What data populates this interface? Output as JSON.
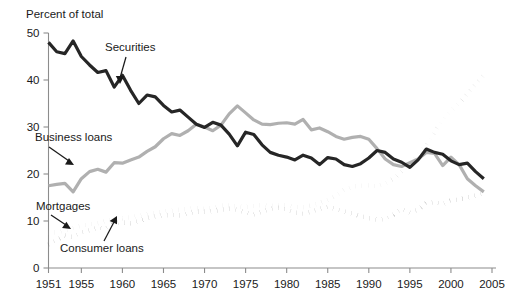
{
  "chart_data": {
    "type": "line",
    "title": "",
    "ylabel": "Percent of total",
    "xlabel": "",
    "xlim": [
      1951,
      2005
    ],
    "ylim": [
      0,
      50
    ],
    "grid": false,
    "legend_position": "inline-annotations",
    "y_ticks": [
      "0",
      "10",
      "20",
      "30",
      "40",
      "50"
    ],
    "y_tick_values": [
      0,
      10,
      20,
      30,
      40,
      50
    ],
    "x_ticks": [
      "1951",
      "1955",
      "1960",
      "1965",
      "1970",
      "1975",
      "1980",
      "1985",
      "1990",
      "1995",
      "2000",
      "2005"
    ],
    "x_tick_values": [
      1951,
      1955,
      1960,
      1965,
      1970,
      1975,
      1980,
      1985,
      1990,
      1995,
      2000,
      2005
    ],
    "x": [
      1951,
      1952,
      1953,
      1954,
      1955,
      1956,
      1957,
      1958,
      1959,
      1960,
      1961,
      1962,
      1963,
      1964,
      1965,
      1966,
      1967,
      1968,
      1969,
      1970,
      1971,
      1972,
      1973,
      1974,
      1975,
      1976,
      1977,
      1978,
      1979,
      1980,
      1981,
      1982,
      1983,
      1984,
      1985,
      1986,
      1987,
      1988,
      1989,
      1990,
      1991,
      1992,
      1993,
      1994,
      1995,
      1996,
      1997,
      1998,
      1999,
      2000,
      2001,
      2002,
      2003,
      2004
    ],
    "series": [
      {
        "name": "Securities",
        "style": "solid",
        "color": "#262626",
        "line_width": 3.2,
        "values": [
          48.0,
          46.0,
          45.6,
          48.3,
          45.0,
          43.2,
          41.6,
          42.0,
          38.5,
          41.0,
          37.8,
          35.0,
          36.8,
          36.4,
          34.6,
          33.2,
          33.6,
          32.1,
          30.6,
          29.9,
          31.0,
          30.4,
          28.5,
          26.0,
          28.9,
          28.4,
          26.2,
          24.6,
          24.0,
          23.6,
          23.0,
          24.0,
          23.4,
          22.0,
          23.5,
          23.2,
          22.0,
          21.6,
          22.2,
          23.4,
          25.0,
          24.6,
          23.2,
          22.5,
          21.4,
          23.0,
          25.3,
          24.6,
          24.2,
          22.8,
          22.0,
          22.3,
          20.5,
          19.0
        ]
      },
      {
        "name": "Business loans",
        "style": "solid",
        "color": "#b0b0b0",
        "line_width": 3.2,
        "values": [
          17.5,
          17.8,
          18.0,
          16.2,
          19.0,
          20.5,
          21.0,
          20.4,
          22.4,
          22.3,
          23.0,
          23.6,
          24.8,
          25.8,
          27.5,
          28.6,
          28.2,
          29.2,
          30.6,
          30.0,
          29.2,
          30.4,
          32.8,
          34.5,
          33.0,
          31.5,
          30.6,
          30.5,
          30.8,
          30.9,
          30.6,
          31.6,
          29.4,
          29.8,
          29.0,
          28.0,
          27.4,
          27.8,
          28.0,
          27.4,
          25.4,
          23.2,
          22.0,
          21.6,
          22.4,
          23.2,
          24.6,
          24.4,
          21.8,
          23.6,
          22.0,
          19.0,
          17.5,
          16.2
        ]
      },
      {
        "name": "Mortgages",
        "style": "dotted",
        "color": "#b8b8b8",
        "line_width": 4.6,
        "values": [
          7.5,
          7.6,
          8.0,
          8.5,
          9.0,
          9.3,
          9.5,
          10.0,
          10.5,
          10.6,
          10.8,
          11.1,
          11.4,
          11.8,
          12.0,
          12.2,
          12.4,
          12.6,
          12.7,
          12.6,
          12.8,
          13.3,
          13.3,
          13.1,
          13.0,
          13.2,
          13.4,
          13.2,
          13.3,
          13.4,
          13.0,
          12.9,
          13.3,
          13.8,
          14.5,
          15.4,
          16.6,
          17.3,
          17.5,
          17.6,
          17.4,
          18.0,
          19.0,
          20.6,
          22.0,
          24.5,
          26.0,
          29.0,
          31.5,
          33.5,
          35.0,
          37.0,
          39.0,
          41.0
        ]
      },
      {
        "name": "Consumer loans",
        "style": "dotted",
        "color": "#1f1f1f",
        "line_width": 4.6,
        "values": [
          5.0,
          6.0,
          6.9,
          6.6,
          7.6,
          8.0,
          8.6,
          8.4,
          9.6,
          9.7,
          9.5,
          10.0,
          10.6,
          11.0,
          11.2,
          11.3,
          11.2,
          11.6,
          12.0,
          12.0,
          12.1,
          12.4,
          12.6,
          12.4,
          11.8,
          11.4,
          12.0,
          12.6,
          12.8,
          12.4,
          11.8,
          11.6,
          12.0,
          12.6,
          13.0,
          12.6,
          12.0,
          11.6,
          11.0,
          10.6,
          10.3,
          10.4,
          11.4,
          12.6,
          11.8,
          12.4,
          13.8,
          14.0,
          13.6,
          14.4,
          14.6,
          15.0,
          15.4,
          16.0
        ]
      }
    ],
    "annotations": [
      {
        "label": "Securities",
        "name": "securities-annotation"
      },
      {
        "label": "Business loans",
        "name": "business-loans-annotation"
      },
      {
        "label": "Mortgages",
        "name": "mortgages-annotation"
      },
      {
        "label": "Consumer loans",
        "name": "consumer-loans-annotation"
      }
    ]
  }
}
